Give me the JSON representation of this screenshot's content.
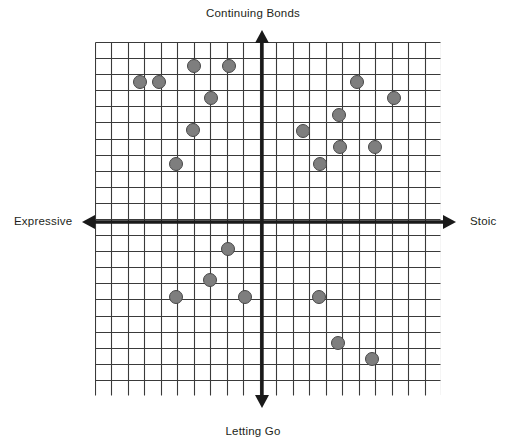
{
  "chart_data": {
    "type": "scatter",
    "title": "",
    "subtitle": "",
    "axis_labels": {
      "top": "Continuing Bonds",
      "bottom": "Letting Go",
      "left": "Expressive",
      "right": "Stoic"
    },
    "xlabel": "Expressive ↔ Stoic",
    "ylabel": "Letting Go ↔ Continuing Bonds",
    "grid": true,
    "grid_columns": 21,
    "grid_rows": 22,
    "legend": "none",
    "xlim": [
      -10.5,
      10.5
    ],
    "ylim": [
      -11.0,
      11.0
    ],
    "origin_cell": {
      "x": 10.5,
      "y": 11.25
    },
    "point_style": {
      "fill": "#7e7e7e",
      "stroke": "#474747",
      "diameter_px": 14
    },
    "x": [
      -4.3,
      -2.1,
      -7.6,
      -6.4,
      -3.1,
      -4.3,
      -5.4,
      5.9,
      8.3,
      4.8,
      2.5,
      4.9,
      7.1,
      3.6,
      -2.1,
      -3.3,
      -5.4,
      -1.1,
      3.6,
      4.8,
      6.9
    ],
    "y": [
      9.8,
      9.8,
      8.8,
      8.8,
      7.8,
      5.8,
      3.6,
      8.8,
      7.8,
      6.7,
      5.7,
      4.6,
      4.6,
      3.6,
      -1.7,
      -3.6,
      -4.7,
      -4.7,
      -4.7,
      -7.6,
      -8.6
    ],
    "points": [
      {
        "id": "p1",
        "x": -4.3,
        "y": 9.8,
        "px": 194,
        "py": 66,
        "quadrant": "expressive-continuing"
      },
      {
        "id": "p2",
        "x": -2.1,
        "y": 9.8,
        "px": 229,
        "py": 66,
        "quadrant": "expressive-continuing"
      },
      {
        "id": "p3",
        "x": -7.6,
        "y": 8.8,
        "px": 140,
        "py": 82,
        "quadrant": "expressive-continuing"
      },
      {
        "id": "p4",
        "x": -6.4,
        "y": 8.8,
        "px": 159,
        "py": 82,
        "quadrant": "expressive-continuing"
      },
      {
        "id": "p5",
        "x": -3.1,
        "y": 7.8,
        "px": 211,
        "py": 98,
        "quadrant": "expressive-continuing"
      },
      {
        "id": "p6",
        "x": -4.3,
        "y": 5.8,
        "px": 193,
        "py": 130,
        "quadrant": "expressive-continuing"
      },
      {
        "id": "p7",
        "x": -5.4,
        "y": 3.6,
        "px": 176,
        "py": 164,
        "quadrant": "expressive-continuing"
      },
      {
        "id": "p8",
        "x": 5.9,
        "y": 8.8,
        "px": 357,
        "py": 82,
        "quadrant": "stoic-continuing"
      },
      {
        "id": "p9",
        "x": 8.3,
        "y": 7.8,
        "px": 394,
        "py": 98,
        "quadrant": "stoic-continuing"
      },
      {
        "id": "p10",
        "x": 4.8,
        "y": 6.7,
        "px": 339,
        "py": 115,
        "quadrant": "stoic-continuing"
      },
      {
        "id": "p11",
        "x": 2.5,
        "y": 5.7,
        "px": 303,
        "py": 131,
        "quadrant": "stoic-continuing"
      },
      {
        "id": "p12",
        "x": 4.9,
        "y": 4.6,
        "px": 340,
        "py": 147,
        "quadrant": "stoic-continuing"
      },
      {
        "id": "p13",
        "x": 7.1,
        "y": 4.6,
        "px": 375,
        "py": 147,
        "quadrant": "stoic-continuing"
      },
      {
        "id": "p14",
        "x": 3.6,
        "y": 3.6,
        "px": 320,
        "py": 164,
        "quadrant": "stoic-continuing"
      },
      {
        "id": "p15",
        "x": -2.1,
        "y": -1.7,
        "px": 228,
        "py": 249,
        "quadrant": "expressive-letting-go"
      },
      {
        "id": "p16",
        "x": -3.3,
        "y": -3.6,
        "px": 210,
        "py": 280,
        "quadrant": "expressive-letting-go"
      },
      {
        "id": "p17",
        "x": -5.4,
        "y": -4.7,
        "px": 176,
        "py": 297,
        "quadrant": "expressive-letting-go"
      },
      {
        "id": "p18",
        "x": -1.1,
        "y": -4.7,
        "px": 245,
        "py": 297,
        "quadrant": "expressive-letting-go"
      },
      {
        "id": "p19",
        "x": 3.6,
        "y": -4.7,
        "px": 319,
        "py": 297,
        "quadrant": "stoic-letting-go"
      },
      {
        "id": "p20",
        "x": 4.8,
        "y": -7.6,
        "px": 338,
        "py": 343,
        "quadrant": "stoic-letting-go"
      },
      {
        "id": "p21",
        "x": 6.9,
        "y": -8.6,
        "px": 372,
        "py": 359,
        "quadrant": "stoic-letting-go"
      }
    ],
    "point_count": 21
  },
  "colors": {
    "background": "#ffffff",
    "grid_line": "#3a3a3a",
    "axis_line": "#1a1a1a",
    "dot_fill": "#7e7e7e",
    "dot_stroke": "#474747",
    "text": "#231f20"
  }
}
